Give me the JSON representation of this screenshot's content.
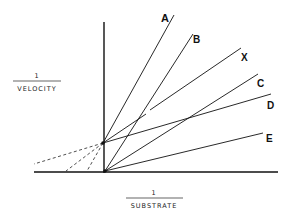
{
  "diagram": {
    "type": "double-reciprocal (Lineweaver-Burk) plot",
    "y_axis_label": {
      "numerator": "1",
      "denominator": "VELOCITY"
    },
    "x_axis_label": {
      "numerator": "1",
      "denominator": "SUBSTRATE"
    },
    "lines": [
      {
        "id": "A",
        "label": "A"
      },
      {
        "id": "B",
        "label": "B"
      },
      {
        "id": "X",
        "label": "X"
      },
      {
        "id": "C",
        "label": "C"
      },
      {
        "id": "D",
        "label": "D"
      },
      {
        "id": "E",
        "label": "E"
      }
    ],
    "colors": {
      "ink": "#111111",
      "background": "#ffffff"
    }
  }
}
